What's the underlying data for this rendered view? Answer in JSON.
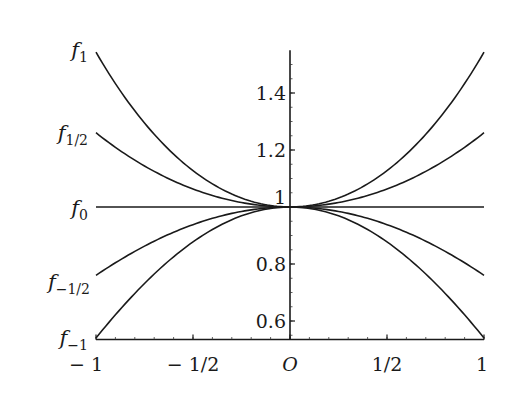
{
  "chart_data": {
    "type": "line",
    "title": "",
    "xlabel": "",
    "ylabel": "",
    "xlim": [
      -1,
      1
    ],
    "ylim": [
      0.535,
      1.55
    ],
    "grid": false,
    "legend_position": "inline-left",
    "x_ticks": [
      {
        "value": -1,
        "label": "− 1"
      },
      {
        "value": -0.5,
        "label": "− 1/2"
      },
      {
        "value": 0,
        "label": "O"
      },
      {
        "value": 0.5,
        "label": "1/2"
      },
      {
        "value": 1,
        "label": "1"
      }
    ],
    "y_ticks": [
      {
        "value": 0.6,
        "label": "0.6"
      },
      {
        "value": 0.8,
        "label": "0.8"
      },
      {
        "value": 1.0,
        "label": "1"
      },
      {
        "value": 1.2,
        "label": "1.2"
      },
      {
        "value": 1.4,
        "label": "1.4"
      }
    ],
    "x": [
      -1,
      -0.75,
      -0.5,
      -0.25,
      0,
      0.25,
      0.5,
      0.75,
      1
    ],
    "series": [
      {
        "name": "f_1",
        "label_main": "f",
        "label_sub": "1",
        "a": 1,
        "values": [
          1.543,
          1.295,
          1.128,
          1.031,
          1.0,
          1.031,
          1.128,
          1.295,
          1.543
        ]
      },
      {
        "name": "f_1/2",
        "label_main": "f",
        "label_sub": "1/2",
        "a": 0.5,
        "values": [
          1.26,
          1.144,
          1.063,
          1.016,
          1.0,
          1.016,
          1.063,
          1.144,
          1.26
        ]
      },
      {
        "name": "f_0",
        "label_main": "f",
        "label_sub": "0",
        "a": 0,
        "values": [
          1.0,
          1.0,
          1.0,
          1.0,
          1.0,
          1.0,
          1.0,
          1.0,
          1.0
        ]
      },
      {
        "name": "f_-1/2",
        "label_main": "f",
        "label_sub": "−1/2",
        "a": -0.5,
        "values": [
          0.76,
          0.862,
          0.939,
          0.984,
          1.0,
          0.984,
          0.939,
          0.862,
          0.76
        ]
      },
      {
        "name": "f_-1",
        "label_main": "f",
        "label_sub": "−1",
        "a": -1,
        "values": [
          0.54,
          0.732,
          0.878,
          0.969,
          1.0,
          0.969,
          0.878,
          0.732,
          0.54
        ]
      }
    ],
    "annotations": [
      "f_a(x) = cosh(√a·x) family; all curves pass through (0, 1)"
    ]
  }
}
